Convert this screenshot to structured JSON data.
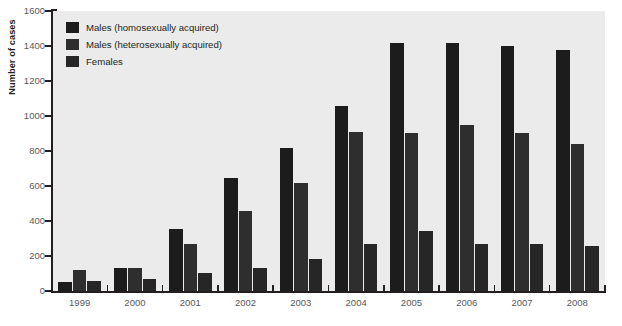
{
  "chart_data": {
    "type": "bar",
    "title": "",
    "xlabel": "",
    "ylabel": "Number of cases",
    "categories": [
      "1999",
      "2000",
      "2001",
      "2002",
      "2003",
      "2004",
      "2005",
      "2006",
      "2007",
      "2008"
    ],
    "ylim": [
      0,
      1600
    ],
    "yticks": [
      0,
      200,
      400,
      600,
      800,
      1000,
      1200,
      1400,
      1600
    ],
    "grid": false,
    "legend_position": "top-left",
    "series": [
      {
        "name": "Males (homosexually acquired)",
        "color": "#1c1c1c",
        "values": [
          50,
          130,
          355,
          645,
          815,
          1060,
          1415,
          1415,
          1400,
          1375
        ]
      },
      {
        "name": "Males (heterosexually acquired)",
        "color": "#2e2e2e",
        "values": [
          120,
          130,
          270,
          455,
          620,
          910,
          905,
          950,
          905,
          840
        ]
      },
      {
        "name": "Females",
        "color": "#262626",
        "values": [
          60,
          70,
          105,
          130,
          185,
          270,
          345,
          270,
          270,
          255
        ]
      }
    ]
  },
  "axis": {
    "y_title": "Number of cases"
  },
  "caption": {
    "prefix": "",
    "text": ""
  },
  "colors": {
    "plot_background": "#ebebeb",
    "page_background": "#ffffff",
    "axis": "#231f20",
    "tick_label": "#58585b"
  }
}
